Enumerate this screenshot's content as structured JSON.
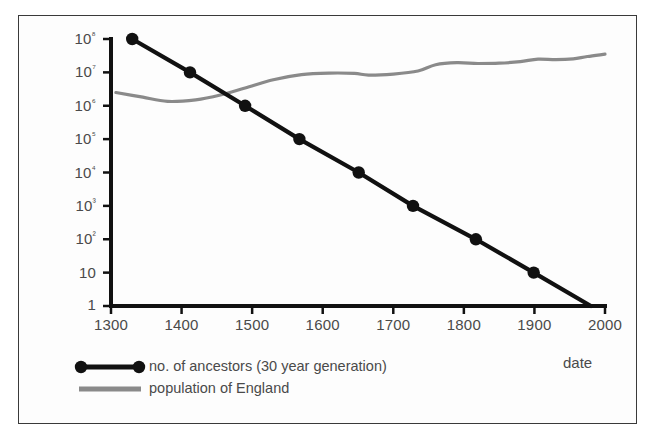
{
  "chart_data": {
    "type": "line",
    "title": "",
    "xlabel": "date",
    "ylabel": "",
    "xlim": [
      1300,
      2000
    ],
    "ylim": [
      1,
      100000000
    ],
    "yscale": "log",
    "grid": false,
    "legend_position": "below-left",
    "xticks": [
      1300,
      1400,
      1500,
      1600,
      1700,
      1800,
      1900,
      2000
    ],
    "xticklabels": [
      "1300",
      "1400",
      "1500",
      "1600",
      "1700",
      "1800",
      "1900",
      "2000"
    ],
    "yticks": [
      1,
      10,
      100,
      1000,
      10000,
      100000,
      1000000,
      10000000,
      100000000
    ],
    "yticklabels": [
      "1",
      "10",
      "10²",
      "10³",
      "10⁴",
      "10⁵",
      "10⁶",
      "10⁷",
      "10⁸"
    ],
    "series": [
      {
        "name": "no. of ancestors (30 year generation)",
        "color": "#111111",
        "marker": "circle",
        "x": [
          1330,
          1412,
          1490,
          1567,
          1651,
          1728,
          1817,
          1899,
          1980
        ],
        "values": [
          100000000,
          10000000,
          1000000,
          100000,
          10000,
          1000,
          100,
          10,
          1
        ]
      },
      {
        "name": "population of England",
        "color": "#8a8a8a",
        "marker": "none",
        "x": [
          1307,
          1345,
          1380,
          1420,
          1455,
          1490,
          1530,
          1570,
          1610,
          1645,
          1665,
          1700,
          1735,
          1760,
          1790,
          1820,
          1850,
          1880,
          1905,
          1930,
          1955,
          1975,
          2000
        ],
        "values": [
          2500000,
          1800000,
          1350000,
          1500000,
          2100000,
          3400000,
          6000000,
          8600000,
          9500000,
          9300000,
          8300000,
          8900000,
          11000000,
          17000000,
          19500000,
          18500000,
          18800000,
          21000000,
          25000000,
          24000000,
          25500000,
          30000000,
          35000000
        ]
      }
    ]
  },
  "legend": {
    "items": [
      {
        "label": "no. of ancestors (30 year generation)",
        "swatch": "black-line-with-dots"
      },
      {
        "label": "population of England",
        "swatch": "gray-line"
      }
    ]
  },
  "axis_title": {
    "x": "date"
  }
}
